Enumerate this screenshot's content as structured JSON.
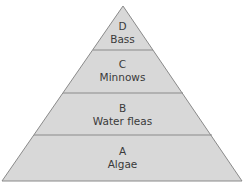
{
  "diagram": {
    "type": "food-pyramid",
    "colors": {
      "fill": "#d8d8d8",
      "stroke": "#8a8a8a",
      "text": "#3a3a3a"
    },
    "layers": [
      {
        "letter": "D",
        "name": "Bass"
      },
      {
        "letter": "C",
        "name": "Minnows"
      },
      {
        "letter": "B",
        "name": "Water fleas"
      },
      {
        "letter": "A",
        "name": "Algae"
      }
    ]
  }
}
